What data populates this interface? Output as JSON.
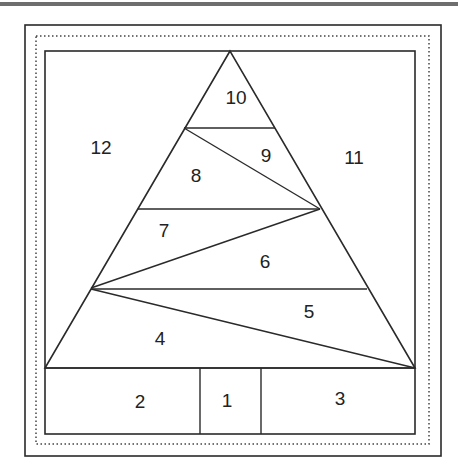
{
  "diagram": {
    "pieces": [
      {
        "id": "1",
        "label": "1",
        "x": 227,
        "y": 402
      },
      {
        "id": "2",
        "label": "2",
        "x": 140,
        "y": 403
      },
      {
        "id": "3",
        "label": "3",
        "x": 340,
        "y": 400
      },
      {
        "id": "4",
        "label": "4",
        "x": 160,
        "y": 340
      },
      {
        "id": "5",
        "label": "5",
        "x": 309,
        "y": 313
      },
      {
        "id": "6",
        "label": "6",
        "x": 265,
        "y": 263
      },
      {
        "id": "7",
        "label": "7",
        "x": 164,
        "y": 232
      },
      {
        "id": "8",
        "label": "8",
        "x": 196,
        "y": 177
      },
      {
        "id": "9",
        "label": "9",
        "x": 266,
        "y": 157
      },
      {
        "id": "10",
        "label": "10",
        "x": 236,
        "y": 99
      },
      {
        "id": "11",
        "label": "11",
        "x": 354,
        "y": 159
      },
      {
        "id": "12",
        "label": "12",
        "x": 101,
        "y": 149
      }
    ],
    "colors": {
      "line": "#2a2a2a",
      "text": "#222222",
      "topbar": "#6e6e6e"
    }
  }
}
